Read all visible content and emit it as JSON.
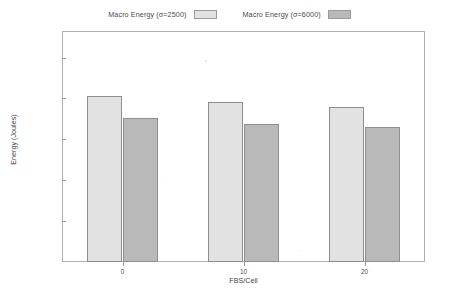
{
  "chart_data": {
    "type": "bar",
    "title": "",
    "subtitle": "",
    "xlabel": "FBS/Cell",
    "ylabel": "Energy (Joules)",
    "categories": [
      "0",
      "10",
      "20"
    ],
    "series": [
      {
        "name": "Macro Energy (σ=2500)",
        "color": "#e2e2e2",
        "values": [
          8130,
          7830,
          7570
        ]
      },
      {
        "name": "Macro Energy (σ=6000)",
        "color": "#b9b9b9",
        "values": [
          7060,
          6760,
          6610
        ]
      }
    ],
    "ylim": [
      0,
      11300
    ],
    "yticks": [
      2000,
      4000,
      6000,
      8000,
      10000
    ],
    "ytick_labels": [
      "2000",
      "4000",
      "6000",
      "8000",
      "10000"
    ],
    "xtick_labels": [
      "0",
      "10",
      "20"
    ],
    "grid": false,
    "legend_position": "top-center",
    "frame": true
  },
  "legend": {
    "entries": [
      {
        "label": "Macro Energy (σ=2500)",
        "color": "#e2e2e2"
      },
      {
        "label": "Macro Energy (σ=6000)",
        "color": "#b9b9b9"
      }
    ]
  },
  "axes": {
    "x_title": "FBS/Cell",
    "y_title": "Energy (Joules)"
  },
  "colors": {
    "series_light": "#e2e2e2",
    "series_dark": "#b9b9b9",
    "frame": "#b0b0b0",
    "text": "#3f3f3f",
    "background": "#ffffff"
  }
}
